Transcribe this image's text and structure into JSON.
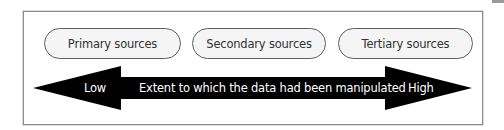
{
  "diagram": {
    "sources": [
      {
        "label": "Primary sources"
      },
      {
        "label": "Secondary sources"
      },
      {
        "label": "Tertiary sources"
      }
    ],
    "axis": {
      "low_label": "Low",
      "center_label": "Extent to which the data had been manipulated",
      "high_label": "High",
      "arrow_color": "#000000",
      "text_color": "#ffffff"
    },
    "colors": {
      "pill_fill": "#f5f5f5",
      "pill_border": "#5e5e5e",
      "frame_border": "#8c8c8c"
    }
  }
}
